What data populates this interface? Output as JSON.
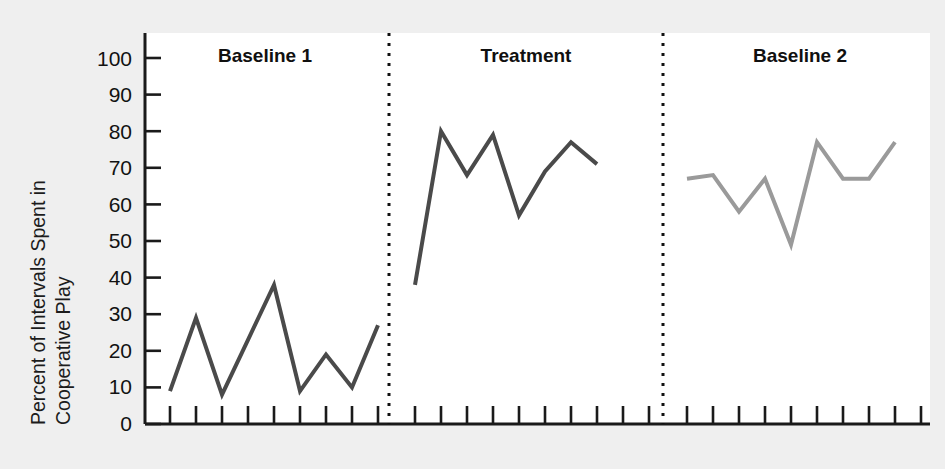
{
  "chart_data": {
    "type": "line",
    "title": "",
    "subtitle": "",
    "xlabel": "",
    "ylabel": "Percent of Intervals Spent in Cooperative Play",
    "ylabel_line1": "Percent of Intervals Spent in",
    "ylabel_line2": "Cooperative Play",
    "ylim": [
      0,
      100
    ],
    "ytick_labels": [
      "0",
      "10",
      "20",
      "30",
      "40",
      "50",
      "60",
      "70",
      "80",
      "90",
      "100"
    ],
    "ytick_values": [
      0,
      10,
      20,
      30,
      40,
      50,
      60,
      70,
      80,
      90,
      100
    ],
    "grid": false,
    "legend": "none",
    "xaxis_ticks_only": true,
    "phase_divider_style": "dotted",
    "phases": [
      {
        "label": "Baseline 1",
        "session_count": 9,
        "line_color": "#4a4a4a",
        "x": [
          1,
          2,
          3,
          4,
          5,
          6,
          7,
          8,
          9
        ],
        "values": [
          9,
          29,
          8,
          23,
          38,
          9,
          19,
          10,
          27
        ]
      },
      {
        "label": "Treatment",
        "session_count": 10,
        "line_color": "#4a4a4a",
        "x": [
          10,
          11,
          12,
          13,
          14,
          15,
          16,
          17
        ],
        "values": [
          38,
          80,
          68,
          79,
          57,
          69,
          77,
          71
        ]
      },
      {
        "label": "Baseline 2",
        "session_count": 10,
        "line_color": "#9a9a9a",
        "x": [
          20,
          21,
          22,
          23,
          24,
          25,
          26,
          27,
          28
        ],
        "values": [
          67,
          68,
          58,
          67,
          49,
          77,
          67,
          67,
          77
        ]
      }
    ],
    "colors": {
      "background": "#efefef",
      "plot_area": "#ffffff",
      "axis": "#1a1a1a",
      "baseline1_line": "#4a4a4a",
      "treatment_line": "#4a4a4a",
      "baseline2_line": "#9a9a9a",
      "divider": "#111111",
      "text": "#121212"
    }
  }
}
